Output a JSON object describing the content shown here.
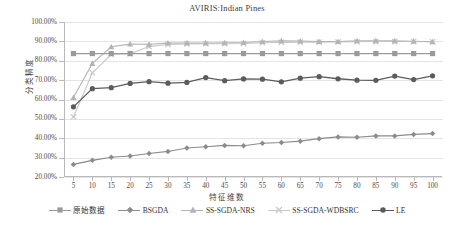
{
  "chart_data": {
    "type": "line",
    "title": "AVIRIS:Indian Pines",
    "xlabel": "特征维数",
    "ylabel": "分类精度",
    "grid": true,
    "legend_position": "bottom",
    "xlim": [
      5,
      100
    ],
    "ylim": [
      20,
      100
    ],
    "ytick_labels": [
      "100.00%",
      "90.00%",
      "80.00%",
      "70.00%",
      "60.00%",
      "50.00%",
      "40.00%",
      "30.00%",
      "20.00%"
    ],
    "ytick_values": [
      100,
      90,
      80,
      70,
      60,
      50,
      40,
      30,
      20
    ],
    "categories": [
      5,
      10,
      15,
      20,
      25,
      30,
      35,
      40,
      45,
      50,
      55,
      60,
      65,
      70,
      75,
      80,
      85,
      90,
      95,
      100
    ],
    "series": [
      {
        "name": "原始数据",
        "marker": "square",
        "color": "#9a9a9a",
        "values": [
          83.7,
          83.7,
          83.7,
          83.7,
          83.7,
          83.7,
          83.7,
          83.7,
          83.7,
          83.7,
          83.7,
          83.7,
          83.7,
          83.7,
          83.7,
          83.7,
          83.7,
          83.7,
          83.7,
          83.7
        ]
      },
      {
        "name": "BSGDA",
        "marker": "diamond",
        "color": "#8c8c8c",
        "values": [
          26.5,
          28.6,
          30.2,
          30.8,
          32.1,
          33.2,
          35.0,
          35.6,
          36.3,
          36.1,
          37.4,
          37.8,
          38.5,
          39.8,
          40.7,
          40.5,
          41.2,
          41.2,
          42.0,
          42.4
        ]
      },
      {
        "name": "SS-SGDA-NRS",
        "marker": "triangle",
        "color": "#b4b4b4",
        "values": [
          61.0,
          78.6,
          87.2,
          88.6,
          88.5,
          89.1,
          89.2,
          89.2,
          89.3,
          89.4,
          89.9,
          90.3,
          90.2,
          89.9,
          89.9,
          90.3,
          90.3,
          90.3,
          90.1,
          89.8
        ]
      },
      {
        "name": "SS-SGDA-WDBSRC",
        "marker": "cross",
        "color": "#c8c8c8",
        "values": [
          51.0,
          73.8,
          83.2,
          83.6,
          87.3,
          88.4,
          88.7,
          88.8,
          88.8,
          88.9,
          89.3,
          89.5,
          89.6,
          89.6,
          89.7,
          89.8,
          89.9,
          89.9,
          89.9,
          89.8
        ]
      },
      {
        "name": "LE",
        "marker": "circle",
        "color": "#5c5c5c",
        "values": [
          56.2,
          65.6,
          66.1,
          68.3,
          69.2,
          68.4,
          68.8,
          71.3,
          69.7,
          70.6,
          70.5,
          69.1,
          71.0,
          71.8,
          70.7,
          70.0,
          69.9,
          72.1,
          70.3,
          72.2
        ]
      }
    ]
  }
}
